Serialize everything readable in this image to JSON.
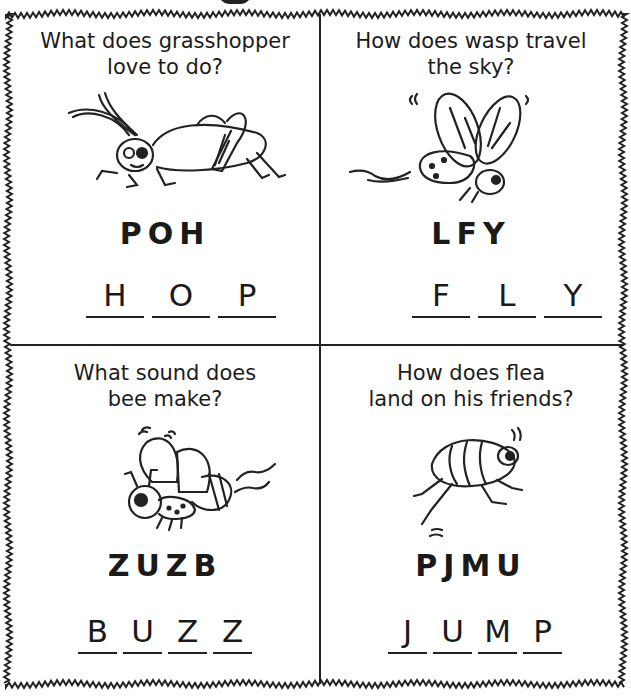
{
  "worksheet": {
    "puzzles": [
      {
        "question_line1": "What does grasshopper",
        "question_line2": "love to do?",
        "illustration": "grasshopper-illustration",
        "scrambled": "POH",
        "answer": [
          "H",
          "O",
          "P"
        ]
      },
      {
        "question_line1": "How does wasp travel",
        "question_line2": "the sky?",
        "illustration": "wasp-illustration",
        "scrambled": "LFY",
        "answer": [
          "F",
          "L",
          "Y"
        ]
      },
      {
        "question_line1": "What sound does",
        "question_line2": "bee make?",
        "illustration": "bee-illustration",
        "scrambled": "ZUZB",
        "answer": [
          "B",
          "U",
          "Z",
          "Z"
        ]
      },
      {
        "question_line1": "How does flea",
        "question_line2": "land on his friends?",
        "illustration": "flea-illustration",
        "scrambled": "PJMU",
        "answer": [
          "J",
          "U",
          "M",
          "P"
        ]
      }
    ]
  }
}
